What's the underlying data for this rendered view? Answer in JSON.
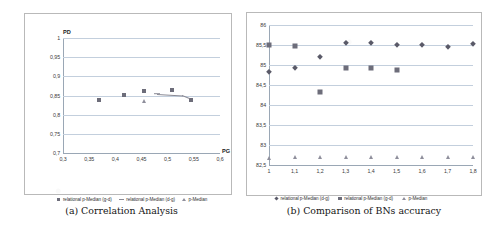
{
  "figure": {
    "panels": [
      {
        "caption": "(a) Correlation Analysis",
        "chart_data": {
          "type": "scatter",
          "title": "",
          "xlabel": "PG",
          "ylabel": "PD",
          "xlim": [
            0.3,
            0.6
          ],
          "ylim": [
            0.7,
            1
          ],
          "grid": true,
          "legend_position": "bottom",
          "xticks": [
            "0,3",
            "0,35",
            "0,4",
            "0,45",
            "0,5",
            "0,55",
            "0,6"
          ],
          "yticks": [
            "1",
            "0,95",
            "0,9",
            "0,85",
            "0,8",
            "0,75",
            "0,7"
          ],
          "series": [
            {
              "name": "relational p-Median (g-d)",
              "marker": "square",
              "color": "#6d6d7a",
              "points": [
                {
                  "x": 0.369,
                  "y": 0.838
                },
                {
                  "x": 0.416,
                  "y": 0.852
                },
                {
                  "x": 0.455,
                  "y": 0.862
                },
                {
                  "x": 0.508,
                  "y": 0.864
                },
                {
                  "x": 0.545,
                  "y": 0.838
                }
              ]
            },
            {
              "name": "relational p-Median (d-g)",
              "marker": "line",
              "color": "#8a8a95",
              "points": [
                {
                  "x": 0.479,
                  "y": 0.855
                },
                {
                  "x": 0.528,
                  "y": 0.851
                },
                {
                  "x": 0.543,
                  "y": 0.843
                }
              ]
            },
            {
              "name": "p-Median",
              "marker": "triangle",
              "color": "#8f8f9c",
              "points": [
                {
                  "x": 0.454,
                  "y": 0.836
                }
              ]
            }
          ]
        }
      },
      {
        "caption": "(b) Comparison of BNs accuracy",
        "chart_data": {
          "type": "scatter",
          "title": "",
          "xlabel": "",
          "ylabel": "",
          "xlim": [
            1,
            1.8
          ],
          "ylim": [
            82.5,
            86
          ],
          "grid": true,
          "legend_position": "bottom",
          "xticks": [
            "1",
            "1,1",
            "1,2",
            "1,3",
            "1,4",
            "1,5",
            "1,6",
            "1,7",
            "1,8"
          ],
          "yticks": [
            "86",
            "85,5",
            "85",
            "84,5",
            "84",
            "83,5",
            "83",
            "82,5"
          ],
          "series": [
            {
              "name": "relational p-Median (d-g)",
              "marker": "diamond",
              "color": "#5a5a68",
              "x": [
                1,
                1.1,
                1.2,
                1.3,
                1.4,
                1.5,
                1.6,
                1.7,
                1.8
              ],
              "values": [
                84.82,
                84.93,
                85.2,
                85.55,
                85.56,
                85.5,
                85.49,
                85.44,
                85.52
              ]
            },
            {
              "name": "relational p-Median (g-d)",
              "marker": "square",
              "color": "#6d6d7a",
              "x": [
                1,
                1.1,
                1.2,
                1.3,
                1.4,
                1.5
              ],
              "values": [
                85.5,
                85.47,
                84.32,
                84.92,
                84.92,
                84.87
              ]
            },
            {
              "name": "p-Median",
              "marker": "triangle",
              "color": "#8f8f9c",
              "x": [
                1,
                1.1,
                1.2,
                1.3,
                1.4,
                1.5,
                1.6,
                1.7,
                1.8
              ],
              "values": [
                82.68,
                82.69,
                82.69,
                82.7,
                82.7,
                82.7,
                82.71,
                82.71,
                82.71
              ]
            }
          ]
        }
      }
    ]
  }
}
